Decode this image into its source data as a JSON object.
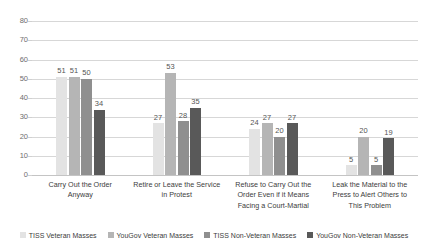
{
  "chart_data": {
    "type": "bar",
    "title": "",
    "xlabel": "",
    "ylabel": "",
    "ylim": [
      0,
      80
    ],
    "yticks": [
      80,
      70,
      60,
      50,
      40,
      30,
      20,
      10,
      0
    ],
    "grid": true,
    "legend_position": "bottom",
    "categories": [
      "Carry Out the Order Anyway",
      "Retire or Leave the Service in Protest",
      "Refuse to Carry Out the Order Even if it Means Facing a Court-Martial",
      "Leak the Material to the Press to Alert Others to This Problem"
    ],
    "category_lines": [
      [
        "Carry Out the Order",
        "Anyway"
      ],
      [
        "Retire or Leave the Service",
        "in Protest"
      ],
      [
        "Refuse to Carry Out the",
        "Order Even if it Means",
        "Facing a Court-Martial"
      ],
      [
        "Leak the Material to the",
        "Press to Alert Others to",
        "This Problem"
      ]
    ],
    "series": [
      {
        "name": "TISS Veteran Masses",
        "color": "#e3e3e3",
        "values": [
          51,
          27,
          24,
          5
        ]
      },
      {
        "name": "YouGov Veteran Masses",
        "color": "#b5b5b5",
        "values": [
          51,
          53,
          27,
          20
        ]
      },
      {
        "name": "TISS Non-Veteran Masses",
        "color": "#8f8f8f",
        "values": [
          50,
          28,
          20,
          5
        ]
      },
      {
        "name": "YouGov Non-Veteran Masses",
        "color": "#595959",
        "values": [
          34,
          35,
          27,
          19
        ]
      }
    ]
  },
  "colors": {
    "background": "#ffffff",
    "gridline": "#d7d7d7",
    "axis_text": "#6e6e6e",
    "label_text": "#3c3c3c"
  }
}
